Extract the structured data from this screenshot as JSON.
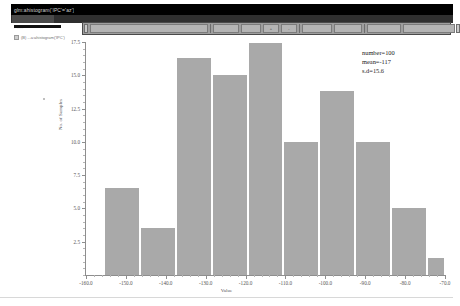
{
  "window": {
    "title": "glm:ahistogram('IPC'='az')",
    "menu_selected": "Plots",
    "tree_item_label": "(B) ...a:ahistogram('IPC')"
  },
  "toolbar": {
    "buttons": [
      {
        "name": "file-new-button",
        "label": ""
      },
      {
        "name": "file-open-button",
        "label": ""
      },
      {
        "name": "print-button",
        "label": ""
      },
      {
        "name": "zoom-in-button",
        "label": "+"
      },
      {
        "name": "zoom-out-button",
        "label": "-"
      },
      {
        "name": "select-tool-button",
        "label": ""
      },
      {
        "name": "pan-tool-button",
        "label": ""
      },
      {
        "name": "properties-button",
        "label": ""
      },
      {
        "name": "export-button",
        "label": ""
      }
    ]
  },
  "chart_data": {
    "type": "bar",
    "title": "",
    "xlabel": "Value",
    "ylabel": "No. of Samples",
    "xlim": [
      -160.0,
      -70.0
    ],
    "ylim": [
      0,
      17.5
    ],
    "grid": false,
    "bin_width": 9.0,
    "categories": [
      "-151.0",
      "-142.0",
      "-133.0",
      "-124.0",
      "-115.0",
      "-106.0",
      "-97.0",
      "-88.0",
      "-79.0",
      "-70.0"
    ],
    "bin_edges": [
      -155.5,
      -146.5,
      -137.5,
      -128.5,
      -119.5,
      -110.5,
      -101.5,
      -92.5,
      -83.5,
      -74.5,
      -70.0
    ],
    "values": [
      6.5,
      3.5,
      16.3,
      15.0,
      17.4,
      10.0,
      13.8,
      10.0,
      5.0,
      1.3
    ],
    "ytick_labels": [
      "17.5",
      "15.0",
      "12.5",
      "10.0",
      "7.5",
      "5.0",
      "2.5"
    ],
    "ytick_values": [
      17.5,
      15.0,
      12.5,
      10.0,
      7.5,
      5.0,
      2.5
    ],
    "xtick_labels": [
      "-160.0",
      "-150.0",
      "-140.0",
      "-130.0",
      "-120.0",
      "-110.0",
      "-100.0",
      "-90.0",
      "-80.0",
      "-70.0"
    ],
    "xtick_values": [
      -160.0,
      -150.0,
      -140.0,
      -130.0,
      -120.0,
      -110.0,
      -100.0,
      -90.0,
      -80.0,
      -70.0
    ],
    "bar_color": "#a9a9a9",
    "annotations": {
      "number": "number=100",
      "mean": "mean=-117",
      "sd": "s.d=15.6"
    }
  }
}
